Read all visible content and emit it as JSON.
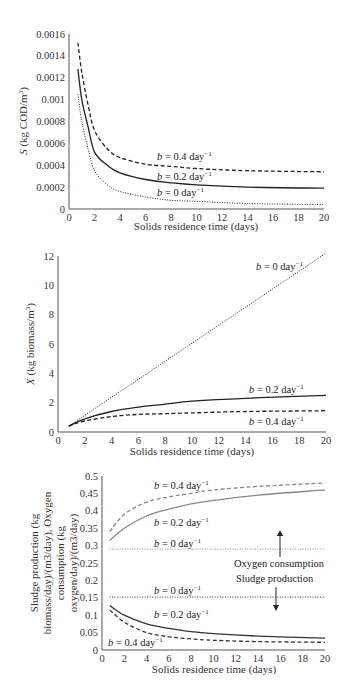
{
  "chart_data": [
    {
      "type": "line",
      "title": "",
      "xlabel": "Solids residence time (days)",
      "ylabel": "S (kg COD/m3)",
      "ylabel_parts": {
        "var": "S",
        "rest": " (kg COD/m",
        "sup": "3",
        "close": ")"
      },
      "xlim": [
        0,
        20
      ],
      "ylim": [
        0,
        0.0016
      ],
      "xticks": [
        "0",
        "2",
        "4",
        "6",
        "8",
        "10",
        "12",
        "14",
        "16",
        "18",
        "20"
      ],
      "yticks": [
        "0",
        "0.0002",
        "0.0004",
        "0.0006",
        "0.0008",
        "0.001",
        "0.0012",
        "0.0014",
        "0.0016"
      ],
      "grid": false,
      "legend_position": "inline labels",
      "series": [
        {
          "name": "b = 0.4 day-1",
          "label": "b = 0.4 day",
          "style": "dashed",
          "x": [
            0.7,
            1,
            1.5,
            2,
            3,
            4,
            6,
            8,
            10,
            14,
            20
          ],
          "values": [
            0.00152,
            0.00125,
            0.00095,
            0.00072,
            0.00055,
            0.00047,
            0.00041,
            0.00039,
            0.00037,
            0.00035,
            0.00034
          ]
        },
        {
          "name": "b = 0.2 day-1",
          "label": "b = 0.2 day",
          "style": "solid",
          "x": [
            0.7,
            1,
            1.5,
            2,
            3,
            4,
            6,
            8,
            10,
            14,
            20
          ],
          "values": [
            0.00128,
            0.001,
            0.00075,
            0.00052,
            0.0004,
            0.00033,
            0.00027,
            0.00024,
            0.00022,
            0.0002,
            0.00019
          ]
        },
        {
          "name": "b = 0 day-1",
          "label": "b = 0 day",
          "style": "dotted",
          "x": [
            0.7,
            1,
            1.5,
            2,
            3,
            4,
            6,
            8,
            10,
            14,
            20
          ],
          "values": [
            0.00105,
            0.0008,
            0.00055,
            0.00035,
            0.00022,
            0.00016,
            0.00011,
            8e-05,
            7e-05,
            5e-05,
            4e-05
          ]
        }
      ]
    },
    {
      "type": "line",
      "title": "",
      "xlabel": "Solids residence time (days)",
      "ylabel": "X (kg biomass/m3)",
      "ylabel_parts": {
        "var": "X",
        "rest": " (kg biomass/m",
        "sup": "3",
        "close": ")"
      },
      "xlim": [
        0,
        20
      ],
      "ylim": [
        0,
        12
      ],
      "xticks": [
        "0",
        "2",
        "4",
        "6",
        "8",
        "10",
        "12",
        "14",
        "16",
        "18",
        "20"
      ],
      "yticks": [
        "0",
        "2",
        "4",
        "6",
        "8",
        "10",
        "12"
      ],
      "grid": false,
      "legend_position": "inline labels",
      "series": [
        {
          "name": "b = 0 day-1",
          "label": "b = 0 day",
          "style": "dotted",
          "x": [
            0.8,
            20
          ],
          "values": [
            0.4,
            12.2
          ]
        },
        {
          "name": "b = 0.2 day-1",
          "label": "b = 0.2 day",
          "style": "solid",
          "x": [
            0.8,
            2,
            4,
            6,
            8,
            10,
            14,
            20
          ],
          "values": [
            0.4,
            0.9,
            1.4,
            1.7,
            1.9,
            2.1,
            2.3,
            2.5
          ]
        },
        {
          "name": "b = 0.4 day-1",
          "label": "b = 0.4 day",
          "style": "dashed",
          "x": [
            0.8,
            2,
            4,
            6,
            8,
            10,
            14,
            20
          ],
          "values": [
            0.4,
            0.75,
            1.05,
            1.2,
            1.25,
            1.3,
            1.4,
            1.45
          ]
        }
      ]
    },
    {
      "type": "line",
      "title": "",
      "xlabel": "Solids residence time (days)",
      "ylabel": "Sludge production (kg biomass/day)/(m3/day), Oxygen consumption (kg oxygen/day)/(m3/day)",
      "ylabel_lines": [
        "Sludge production (kg",
        "biomass/day)/(m3/day), Oxygen",
        "consumption (kg",
        "oxygen/day)/(m3/day)"
      ],
      "xlim": [
        0,
        20
      ],
      "ylim": [
        0,
        0.5
      ],
      "xticks": [
        "0",
        "2",
        "4",
        "6",
        "8",
        "10",
        "12",
        "14",
        "16",
        "18",
        "20"
      ],
      "yticks": [
        "0",
        "0.05",
        "0.1",
        "0.15",
        "0.2",
        "0.25",
        "0.3",
        "0.35",
        "0.4",
        "0.45",
        "0.5"
      ],
      "grid": false,
      "legend_position": "inline labels",
      "annotations": [
        "Oxygen consumption",
        "Sludge production"
      ],
      "series": [
        {
          "name": "Oxygen consumption, b = 0.4 day-1",
          "label": "b = 0.4 day",
          "style": "dashed",
          "color": "#888888",
          "x": [
            0.7,
            2,
            4,
            6,
            8,
            10,
            14,
            20
          ],
          "values": [
            0.34,
            0.39,
            0.425,
            0.44,
            0.45,
            0.46,
            0.47,
            0.48
          ]
        },
        {
          "name": "Oxygen consumption, b = 0.2 day-1",
          "label": "b = 0.2 day",
          "style": "solid",
          "color": "#888888",
          "x": [
            0.7,
            2,
            4,
            6,
            8,
            10,
            14,
            20
          ],
          "values": [
            0.315,
            0.35,
            0.385,
            0.405,
            0.42,
            0.43,
            0.445,
            0.46
          ]
        },
        {
          "name": "Oxygen consumption, b = 0 day-1",
          "label": "b = 0 day",
          "style": "dotted",
          "color": "#888888",
          "x": [
            0.7,
            20
          ],
          "values": [
            0.29,
            0.29
          ]
        },
        {
          "name": "Sludge production, b = 0 day-1",
          "label": "b = 0 day",
          "style": "dotted",
          "color": "#333333",
          "x": [
            0.7,
            20
          ],
          "values": [
            0.152,
            0.152
          ]
        },
        {
          "name": "Sludge production, b = 0.2 day-1",
          "label": "b = 0.2 day",
          "style": "solid",
          "color": "#333333",
          "x": [
            0.7,
            2,
            4,
            6,
            8,
            10,
            14,
            20
          ],
          "values": [
            0.128,
            0.1,
            0.075,
            0.062,
            0.053,
            0.047,
            0.04,
            0.034
          ]
        },
        {
          "name": "Sludge production, b = 0.4 day-1",
          "label": "b = 0.4 day",
          "style": "dashed",
          "color": "#333333",
          "x": [
            0.7,
            2,
            4,
            6,
            8,
            10,
            14,
            20
          ],
          "values": [
            0.115,
            0.08,
            0.05,
            0.038,
            0.032,
            0.028,
            0.024,
            0.022
          ]
        }
      ]
    }
  ],
  "labels": {
    "sup_minus1": "−1",
    "b_var": "b",
    "eq": " = ",
    "c1": {
      "l04": "0.4 day",
      "l02": "0.2 day",
      "l0": "0 day"
    },
    "c2": {
      "l0": "0 day",
      "l02": "0.2 day",
      "l04": "0.4 day"
    },
    "c3": {
      "o04": "0.4 day",
      "o02": "0.2 day",
      "o0": "0 day",
      "s0": "0 day",
      "s02": "0.2 day",
      "s04": "0.4 day"
    }
  }
}
